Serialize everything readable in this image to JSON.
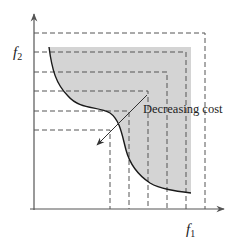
{
  "diagram": {
    "axes": {
      "x_label": "f",
      "x_subscript": "1",
      "y_label": "f",
      "y_subscript": "2"
    },
    "annotation": {
      "text": "Decreasing cost"
    },
    "colors": {
      "region_fill": "#d4d4d4",
      "axis": "#555555",
      "dashed": "#555555",
      "curve": "#1a1a1a"
    },
    "dashed_levels": [
      {
        "y": 33,
        "x": 205
      },
      {
        "y": 52,
        "x": 186
      },
      {
        "y": 72,
        "x": 167
      },
      {
        "y": 91,
        "x": 148
      },
      {
        "y": 111,
        "x": 129
      },
      {
        "y": 130,
        "x": 110
      }
    ]
  }
}
